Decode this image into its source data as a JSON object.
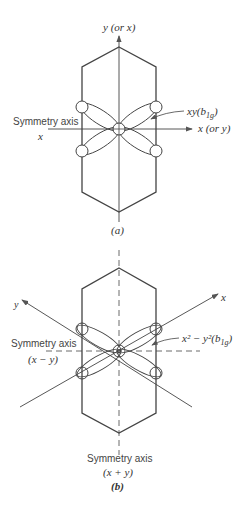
{
  "panel_a": {
    "axis_y_label": "y (or x)",
    "axis_x_label": "x (or y)",
    "symmetry_label": "Symmetry axis",
    "symmetry_axis_var": "x",
    "orbital_label": "xy(b",
    "orbital_sub": "1g",
    "orbital_close": ")",
    "caption": "(a)"
  },
  "panel_b": {
    "axis_y_label": "y",
    "axis_x_label": "x",
    "symmetry_left_label": "Symmetry axis",
    "symmetry_left_var": "(x − y)",
    "orbital_label": "x² − y²(b",
    "orbital_sub": "1g",
    "orbital_close": ")",
    "symmetry_bottom_label": "Symmetry axis",
    "symmetry_bottom_var": "(x + y)",
    "caption": "(b)"
  }
}
